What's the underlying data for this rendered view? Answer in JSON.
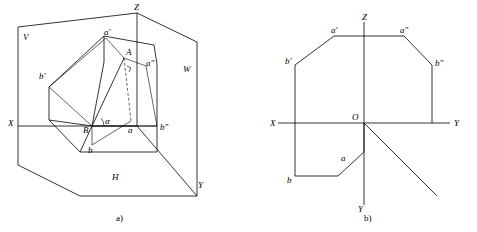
{
  "figure": {
    "caption_a": "a)",
    "caption_b": "b)",
    "panel_a": {
      "name": "pictorial-projection-diagram",
      "plane_labels": [
        "V",
        "W",
        "H"
      ],
      "axis_labels": [
        "Z",
        "X",
        "Y"
      ],
      "point_labels": [
        "a'",
        "A",
        "a\"",
        "b'",
        "B",
        "b\"",
        "b",
        "a",
        "α"
      ]
    },
    "panel_b": {
      "name": "orthographic-projection-diagram",
      "axis_labels": [
        "Z",
        "X",
        "Y",
        "Y",
        "O"
      ],
      "point_labels": [
        "a'",
        "a\"",
        "b'",
        "b\"",
        "a",
        "b"
      ]
    }
  }
}
